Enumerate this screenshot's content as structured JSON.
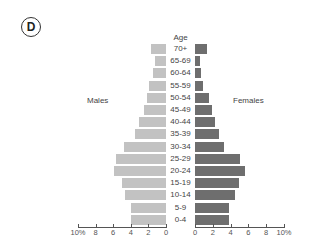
{
  "panel_label": "D",
  "labels": {
    "males": "Males",
    "females": "Females",
    "age_title": "Age"
  },
  "axis": {
    "male_ticks": [
      "10%",
      "8",
      "6",
      "4",
      "2",
      "0"
    ],
    "female_ticks": [
      "0",
      "2",
      "4",
      "6",
      "8",
      "10%"
    ]
  },
  "colors": {
    "male": "#c2c2c2",
    "female": "#6e6e6e"
  },
  "chart_data": {
    "type": "bar",
    "orientation": "horizontal",
    "subtype": "population_pyramid",
    "title": "D",
    "ylabel": "Age",
    "xlabel": "Percent of population",
    "categories": [
      "70+",
      "65-69",
      "60-64",
      "55-59",
      "50-54",
      "45-49",
      "40-44",
      "35-39",
      "30-34",
      "25-29",
      "20-24",
      "15-19",
      "10-14",
      "5-9",
      "0-4"
    ],
    "series": [
      {
        "name": "Males",
        "side": "left",
        "color": "#c2c2c2",
        "values": [
          1.7,
          1.2,
          1.5,
          1.9,
          2.2,
          2.5,
          3.0,
          3.5,
          4.8,
          5.6,
          5.9,
          5.0,
          4.6,
          4.0,
          4.0
        ]
      },
      {
        "name": "Females",
        "side": "right",
        "color": "#6e6e6e",
        "values": [
          1.4,
          0.6,
          0.7,
          0.9,
          1.6,
          1.9,
          2.3,
          2.7,
          3.3,
          5.1,
          5.6,
          5.0,
          4.5,
          3.8,
          3.8
        ]
      }
    ],
    "xlim": [
      0,
      10
    ],
    "xticks": [
      0,
      2,
      4,
      6,
      8,
      10
    ],
    "grid": false,
    "legend": "side labels (Males left, Females right)"
  }
}
